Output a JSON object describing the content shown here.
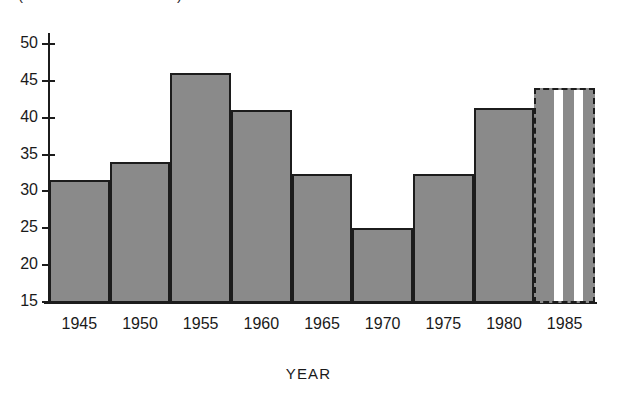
{
  "chart_data": {
    "type": "bar",
    "title": "(PERCENT OF TOTAL)",
    "xlabel": "YEAR",
    "ylabel": "",
    "grid": false,
    "legend": "none",
    "ylim": [
      13,
      52
    ],
    "xlim": [
      1942.5,
      1987.5
    ],
    "ytick_labels": [
      "15",
      "20",
      "25",
      "30",
      "35",
      "40",
      "45",
      "50"
    ],
    "ytick_values": [
      15,
      20,
      25,
      30,
      35,
      40,
      45,
      50
    ],
    "xtick_labels": [
      "1945",
      "1950",
      "1955",
      "1960",
      "1965",
      "1970",
      "1975",
      "1980",
      "1985"
    ],
    "xtick_values": [
      1945,
      1950,
      1955,
      1960,
      1965,
      1970,
      1975,
      1980,
      1985
    ],
    "note": "stepped histogram of 5-year intervals; final interval drawn with dashed outline and white vertical stripes to indicate projected values",
    "bars": [
      {
        "label": "1945",
        "x_start": 1942.5,
        "x_end": 1947.5,
        "value": 31.6,
        "style": "solid"
      },
      {
        "label": "1950",
        "x_start": 1947.5,
        "x_end": 1952.5,
        "value": 34.0,
        "style": "solid"
      },
      {
        "label": "1955",
        "x_start": 1952.5,
        "x_end": 1957.5,
        "value": 46.1,
        "style": "solid"
      },
      {
        "label": "1960",
        "x_start": 1957.5,
        "x_end": 1962.5,
        "value": 41.1,
        "style": "solid"
      },
      {
        "label": "1965",
        "x_start": 1962.5,
        "x_end": 1967.5,
        "value": 32.4,
        "style": "solid"
      },
      {
        "label": "1970",
        "x_start": 1967.5,
        "x_end": 1972.5,
        "value": 25.1,
        "style": "solid"
      },
      {
        "label": "1975",
        "x_start": 1972.5,
        "x_end": 1977.5,
        "value": 32.4,
        "style": "solid"
      },
      {
        "label": "1980",
        "x_start": 1977.5,
        "x_end": 1982.5,
        "value": 41.3,
        "style": "solid"
      },
      {
        "label": "1985",
        "x_start": 1982.5,
        "x_end": 1987.5,
        "value": 44.0,
        "style": "projected"
      }
    ],
    "colors": {
      "bar_fill": "#8a8a8a",
      "bar_outline": "#1c1c1c",
      "projected_stripe": "#ffffff",
      "axis": "#1c1c1c",
      "text": "#1a1a1a",
      "background": "#ffffff"
    }
  }
}
